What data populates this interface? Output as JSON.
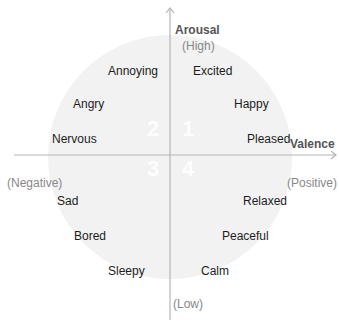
{
  "diagram": {
    "type": "circumplex",
    "colors": {
      "circle_fill": "#f2f2f2",
      "axis": "#b5b5b5",
      "label": "#1c1c1c",
      "axis_note": "#888888",
      "axis_title": "#555555",
      "quadrant_number": "#ffffff"
    },
    "axes": {
      "vertical": {
        "title": "Arousal",
        "top_note": "(High)",
        "bottom_note": "(Low)"
      },
      "horizontal": {
        "title": "Valence",
        "left_note": "(Negative)",
        "right_note": "(Positive)"
      }
    },
    "quadrants": [
      "1",
      "2",
      "3",
      "4"
    ],
    "emotions": [
      {
        "label": "Annoying",
        "quadrant": 2
      },
      {
        "label": "Angry",
        "quadrant": 2
      },
      {
        "label": "Nervous",
        "quadrant": 2
      },
      {
        "label": "Excited",
        "quadrant": 1
      },
      {
        "label": "Happy",
        "quadrant": 1
      },
      {
        "label": "Pleased",
        "quadrant": 1
      },
      {
        "label": "Sad",
        "quadrant": 3
      },
      {
        "label": "Bored",
        "quadrant": 3
      },
      {
        "label": "Sleepy",
        "quadrant": 3
      },
      {
        "label": "Relaxed",
        "quadrant": 4
      },
      {
        "label": "Peaceful",
        "quadrant": 4
      },
      {
        "label": "Calm",
        "quadrant": 4
      }
    ]
  }
}
